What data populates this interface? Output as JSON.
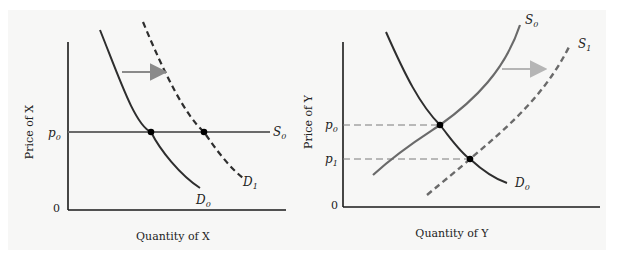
{
  "left_panel": {
    "y_axis_label": "Price of X",
    "x_axis_label": "Quantity of X",
    "origin_label": "0",
    "price_tick": {
      "base": "p",
      "sub": "0"
    },
    "supply_label": {
      "base": "S",
      "sub": "0"
    },
    "demand_initial_label": {
      "base": "D",
      "sub": "0"
    },
    "demand_shifted_label": {
      "base": "D",
      "sub": "1"
    },
    "shift_direction": "right"
  },
  "right_panel": {
    "y_axis_label": "Price of Y",
    "x_axis_label": "Quantity of Y",
    "origin_label": "0",
    "price_tick_0": {
      "base": "p",
      "sub": "0"
    },
    "price_tick_1": {
      "base": "p",
      "sub": "1"
    },
    "supply_initial_label": {
      "base": "S",
      "sub": "0"
    },
    "supply_shifted_label": {
      "base": "S",
      "sub": "1"
    },
    "demand_label": {
      "base": "D",
      "sub": "0"
    },
    "shift_direction": "right"
  },
  "colors": {
    "curve_dark": "#2e2e2e",
    "supply_gray": "#6a6a6a",
    "arrow_left": "#8a8a8a",
    "arrow_right": "#b5b5b5",
    "guide_dash": "#7a7a7a",
    "axis": "#1a1a1a",
    "panel_bg": "#f7f7f6"
  }
}
